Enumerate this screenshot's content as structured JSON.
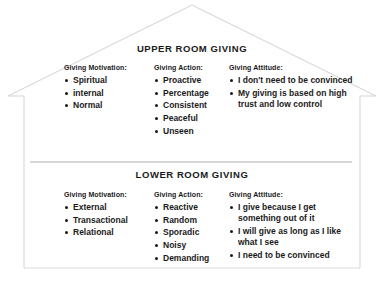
{
  "diagram": {
    "shape": "house",
    "outline_color": "#d9d9d9",
    "divider_color": "#c9c9c9",
    "background": "#ffffff",
    "text_color": "#1a1a1a",
    "bullet_color": "#1a1a1a"
  },
  "upper_room": {
    "title": "UPPER ROOM GIVING",
    "columns": [
      {
        "heading": "Giving Motivation:",
        "items": [
          "Spiritual",
          "internal",
          "Normal"
        ]
      },
      {
        "heading": "Giving Action:",
        "items": [
          "Proactive",
          "Percentage",
          "Consistent",
          "Peaceful",
          "Unseen"
        ]
      },
      {
        "heading": "Giving Attitude:",
        "items": [
          "I don't need to be convinced",
          "My giving is based on high trust and low control"
        ]
      }
    ]
  },
  "lower_room": {
    "title": "LOWER ROOM GIVING",
    "columns": [
      {
        "heading": "Giving Motivation:",
        "items": [
          "External",
          "Transactional",
          "Relational"
        ]
      },
      {
        "heading": "Giving Action:",
        "items": [
          "Reactive",
          "Random",
          "Sporadic",
          "Noisy",
          "Demanding"
        ]
      },
      {
        "heading": "Giving Attitude:",
        "items": [
          "I give because I get something out of it",
          "I will give as long as I like what I see",
          "I need to be convinced"
        ]
      }
    ]
  },
  "caption": ""
}
